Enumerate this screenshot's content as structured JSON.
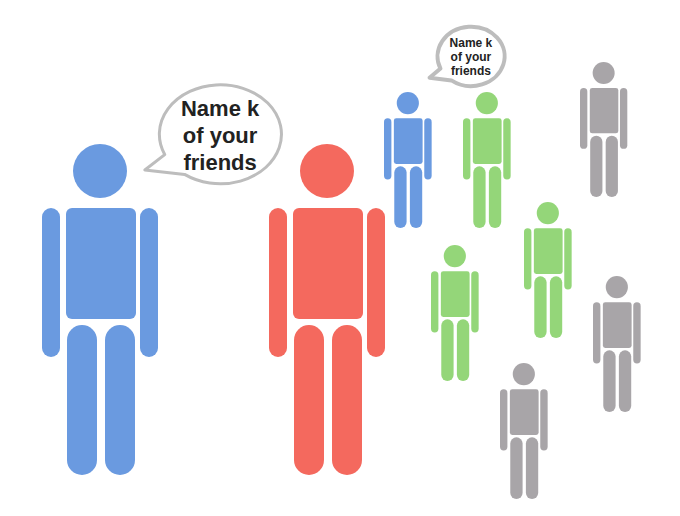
{
  "diagram": {
    "colors": {
      "ego": "#6a9ae0",
      "named_friend": "#f4695e",
      "friend": "#94d679",
      "other": "#a8a5a8",
      "bubble_stroke": "#bdbdbd"
    },
    "bubbles": [
      {
        "name": "large-speech-bubble",
        "lines": [
          "Name k",
          "of your",
          "friends"
        ],
        "x": 142,
        "y": 82,
        "w": 142,
        "h": 110,
        "font_size": 22,
        "line_height": 27,
        "text_top": 13
      },
      {
        "name": "small-speech-bubble",
        "lines": [
          "Name k",
          "of your",
          "friends"
        ],
        "x": 428,
        "y": 25,
        "w": 78,
        "h": 66,
        "font_size": 12,
        "line_height": 14,
        "text_top": 11
      }
    ],
    "figures": [
      {
        "name": "ego-person-large",
        "role": "ego",
        "color": "#6a9ae0",
        "cx": 100,
        "top": 144,
        "height": 331
      },
      {
        "name": "named-friend-red",
        "role": "named_friend",
        "color": "#f4695e",
        "cx": 327,
        "top": 144,
        "height": 331
      },
      {
        "name": "ego-person-small",
        "role": "ego",
        "color": "#6a9ae0",
        "cx": 408,
        "top": 92,
        "height": 136
      },
      {
        "name": "friend-green-1",
        "role": "friend",
        "color": "#94d679",
        "cx": 487,
        "top": 92,
        "height": 136
      },
      {
        "name": "other-gray-1",
        "role": "other",
        "color": "#a8a5a8",
        "cx": 604,
        "top": 62,
        "height": 135
      },
      {
        "name": "friend-green-2",
        "role": "friend",
        "color": "#94d679",
        "cx": 548,
        "top": 202,
        "height": 136
      },
      {
        "name": "friend-green-3",
        "role": "friend",
        "color": "#94d679",
        "cx": 455,
        "top": 245,
        "height": 136
      },
      {
        "name": "other-gray-2",
        "role": "other",
        "color": "#a8a5a8",
        "cx": 617,
        "top": 276,
        "height": 136
      },
      {
        "name": "other-gray-3",
        "role": "other",
        "color": "#a8a5a8",
        "cx": 524,
        "top": 363,
        "height": 136
      }
    ]
  }
}
